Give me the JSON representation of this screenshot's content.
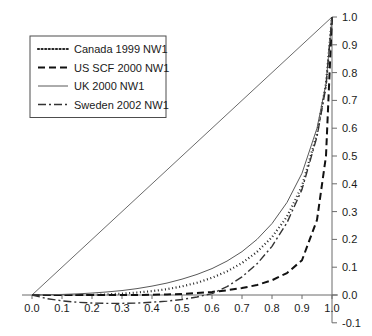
{
  "chart_data": {
    "type": "line",
    "title": "",
    "subtitle": "",
    "xlabel": "",
    "ylabel": "",
    "xlim": [
      0.0,
      1.0
    ],
    "ylim": [
      -0.1,
      1.0
    ],
    "grid": false,
    "legend_position": "upper-left",
    "x_ticks": [
      "0.0",
      "0.1",
      "0.2",
      "0.3",
      "0.4",
      "0.5",
      "0.6",
      "0.7",
      "0.8",
      "0.9",
      "1.0"
    ],
    "x_tick_values": [
      0.0,
      0.1,
      0.2,
      0.3,
      0.4,
      0.5,
      0.6,
      0.7,
      0.8,
      0.9,
      1.0
    ],
    "y_ticks": [
      "1.0",
      "0.9",
      "0.8",
      "0.7",
      "0.6",
      "0.5",
      "0.4",
      "0.3",
      "0.2",
      "0.1",
      "0.0",
      "-0.1"
    ],
    "y_tick_values": [
      1.0,
      0.9,
      0.8,
      0.7,
      0.6,
      0.5,
      0.4,
      0.3,
      0.2,
      0.1,
      0.0,
      -0.1
    ],
    "x": [
      0.0,
      0.05,
      0.1,
      0.15,
      0.2,
      0.25,
      0.3,
      0.35,
      0.4,
      0.45,
      0.5,
      0.55,
      0.6,
      0.65,
      0.7,
      0.75,
      0.8,
      0.85,
      0.9,
      0.95,
      0.98,
      1.0
    ],
    "series": [
      {
        "name": "Canada 1999 NW1",
        "style": "dotted",
        "color": "#262626",
        "width": 2.2,
        "dasharray": "1,2.6",
        "values": [
          0.0,
          0.0,
          0.0,
          0.0,
          0.0,
          0.002,
          0.005,
          0.009,
          0.014,
          0.021,
          0.031,
          0.044,
          0.062,
          0.085,
          0.115,
          0.155,
          0.208,
          0.282,
          0.392,
          0.58,
          0.76,
          1.0
        ]
      },
      {
        "name": "US SCF 2000 NW1",
        "style": "dashed",
        "color": "#111111",
        "width": 2.0,
        "dasharray": "7,4",
        "values": [
          0.0,
          0.0,
          0.0,
          0.0,
          0.0,
          0.0,
          0.0,
          0.0,
          0.001,
          0.002,
          0.004,
          0.007,
          0.011,
          0.017,
          0.025,
          0.036,
          0.053,
          0.079,
          0.125,
          0.27,
          0.5,
          1.0
        ]
      },
      {
        "name": "UK 2000 NW1",
        "style": "solid",
        "color": "#595959",
        "width": 1.0,
        "dasharray": "none",
        "values": [
          0.0,
          0.001,
          0.002,
          0.004,
          0.007,
          0.011,
          0.016,
          0.023,
          0.032,
          0.043,
          0.057,
          0.074,
          0.095,
          0.122,
          0.156,
          0.2,
          0.257,
          0.333,
          0.438,
          0.6,
          0.76,
          1.0
        ]
      },
      {
        "name": "Sweden 2002 NW1",
        "style": "dashdot",
        "color": "#333333",
        "width": 1.4,
        "dasharray": "8,3,2,3",
        "values": [
          0.0,
          -0.013,
          -0.021,
          -0.026,
          -0.029,
          -0.03,
          -0.03,
          -0.029,
          -0.026,
          -0.022,
          -0.016,
          -0.007,
          0.005,
          0.03,
          0.065,
          0.112,
          0.175,
          0.26,
          0.38,
          0.57,
          0.75,
          1.0
        ]
      }
    ],
    "reference_line": {
      "name": "equality-diagonal",
      "from": [
        0.0,
        0.0
      ],
      "to": [
        1.0,
        1.0
      ],
      "color": "#6b6b6b",
      "width": 1.0
    }
  },
  "legend": {
    "entries": [
      {
        "label": "Canada 1999 NW1"
      },
      {
        "label": "US SCF 2000 NW1"
      },
      {
        "label": "UK 2000 NW1"
      },
      {
        "label": "Sweden 2002 NW1"
      }
    ]
  }
}
